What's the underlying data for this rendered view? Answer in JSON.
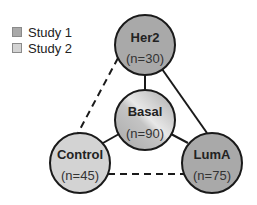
{
  "legend": {
    "items": [
      {
        "label": "Study 1",
        "color": "#a9a9a9"
      },
      {
        "label": "Study 2",
        "color": "#d3d3d3"
      }
    ]
  },
  "nodes": {
    "her2": {
      "title": "Her2",
      "n": "(n=30)",
      "study": "Study 1"
    },
    "basal": {
      "title": "Basal",
      "n": "(n=90)",
      "study": "Study 1 & Study 2"
    },
    "control": {
      "title": "Control",
      "n": "(n=45)",
      "study": "Study 2"
    },
    "luma": {
      "title": "LumA",
      "n": "(n=75)",
      "study": "Study 1"
    }
  },
  "edges": [
    {
      "from": "Her2",
      "to": "Basal",
      "style": "solid"
    },
    {
      "from": "Her2",
      "to": "LumA",
      "style": "solid"
    },
    {
      "from": "Her2",
      "to": "Control",
      "style": "dashed"
    },
    {
      "from": "Basal",
      "to": "Control",
      "style": "solid"
    },
    {
      "from": "Basal",
      "to": "LumA",
      "style": "solid"
    },
    {
      "from": "Control",
      "to": "LumA",
      "style": "dashed"
    }
  ],
  "colors": {
    "study1": "#a9a9a9",
    "study2": "#d3d3d3",
    "stroke": "#1a1a1a"
  }
}
